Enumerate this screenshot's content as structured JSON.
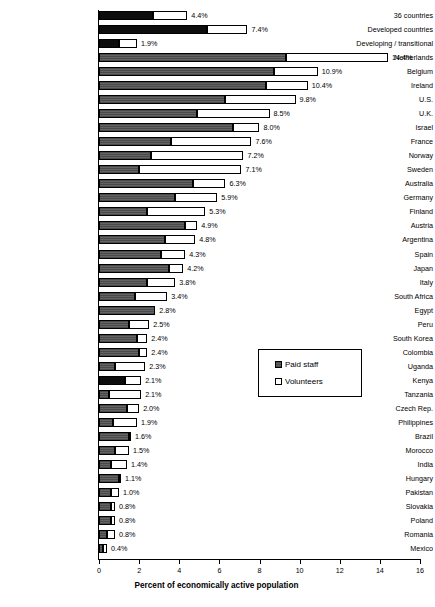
{
  "chart_data": {
    "type": "bar",
    "orientation": "horizontal",
    "stacked": true,
    "title": "",
    "xlabel": "Percent of economically active population",
    "ylabel": "",
    "xlim": [
      0,
      16
    ],
    "xticks": [
      "0",
      "2",
      "4",
      "6",
      "8",
      "10",
      "12",
      "14",
      "16"
    ],
    "grid": false,
    "legend_position": "middle-right",
    "legend": [
      {
        "name": "Paid staff",
        "swatch": "dark"
      },
      {
        "name": "Volunteers",
        "swatch": "white"
      }
    ],
    "series": [
      {
        "name": "Paid staff",
        "color": "#595959"
      },
      {
        "name": "Volunteers",
        "color": "#ffffff"
      }
    ],
    "categories": [
      "36 countries",
      "Developed countries",
      "Developing / transitional",
      "Netherlands",
      "Belgium",
      "Ireland",
      "U.S.",
      "U.K.",
      "Israel",
      "France",
      "Norway",
      "Sweden",
      "Australia",
      "Germany",
      "Finland",
      "Austria",
      "Argentina",
      "Spain",
      "Japan",
      "Italy",
      "South Africa",
      "Egypt",
      "Peru",
      "South Korea",
      "Colombia",
      "Uganda",
      "Kenya",
      "Tanzania",
      "Czech Rep.",
      "Philippines",
      "Brazil",
      "Morocco",
      "India",
      "Hungary",
      "Pakistan",
      "Slovakia",
      "Poland",
      "Romania",
      "Mexico"
    ],
    "totals": [
      4.4,
      7.4,
      1.9,
      14.4,
      10.9,
      10.4,
      9.8,
      8.5,
      8.0,
      7.6,
      7.2,
      7.1,
      6.3,
      5.9,
      5.3,
      4.9,
      4.8,
      4.3,
      4.2,
      3.8,
      3.4,
      2.8,
      2.5,
      2.4,
      2.4,
      2.3,
      2.1,
      2.1,
      2.0,
      1.9,
      1.6,
      1.5,
      1.4,
      1.1,
      1.0,
      0.8,
      0.8,
      0.8,
      0.4
    ],
    "paid_values": [
      2.7,
      5.4,
      1.0,
      9.3,
      8.7,
      8.3,
      6.3,
      4.9,
      6.7,
      3.6,
      2.6,
      2.0,
      4.7,
      3.8,
      2.4,
      4.3,
      3.3,
      3.1,
      3.5,
      2.4,
      1.8,
      2.8,
      1.5,
      1.9,
      2.0,
      0.8,
      1.3,
      0.5,
      1.4,
      0.7,
      1.5,
      0.8,
      0.6,
      1.0,
      0.6,
      0.6,
      0.6,
      0.4,
      0.2
    ],
    "volunteer_values": [
      1.7,
      2.0,
      0.9,
      5.1,
      2.2,
      2.1,
      3.5,
      3.6,
      1.3,
      4.0,
      4.6,
      5.1,
      1.6,
      2.1,
      2.9,
      0.6,
      1.5,
      1.2,
      0.7,
      1.4,
      1.6,
      0.0,
      1.0,
      0.5,
      0.4,
      1.5,
      0.8,
      1.6,
      0.6,
      1.2,
      0.1,
      0.7,
      0.8,
      0.1,
      0.4,
      0.2,
      0.2,
      0.4,
      0.2
    ],
    "labels": [
      "4.4%",
      "7.4%",
      "1.9%",
      "14.4%",
      "10.9%",
      "10.4%",
      "9.8%",
      "8.5%",
      "8.0%",
      "7.6%",
      "7.2%",
      "7.1%",
      "6.3%",
      "5.9%",
      "5.3%",
      "4.9%",
      "4.8%",
      "4.3%",
      "4.2%",
      "3.8%",
      "3.4%",
      "2.8%",
      "2.5%",
      "2.4%",
      "2.4%",
      "2.3%",
      "2.1%",
      "2.1%",
      "2.0%",
      "1.9%",
      "1.6%",
      "1.5%",
      "1.4%",
      "1.1%",
      "1.0%",
      "0.8%",
      "0.8%",
      "0.8%",
      "0.4%"
    ],
    "solid_black_rows": [
      0,
      1,
      2,
      26
    ]
  }
}
